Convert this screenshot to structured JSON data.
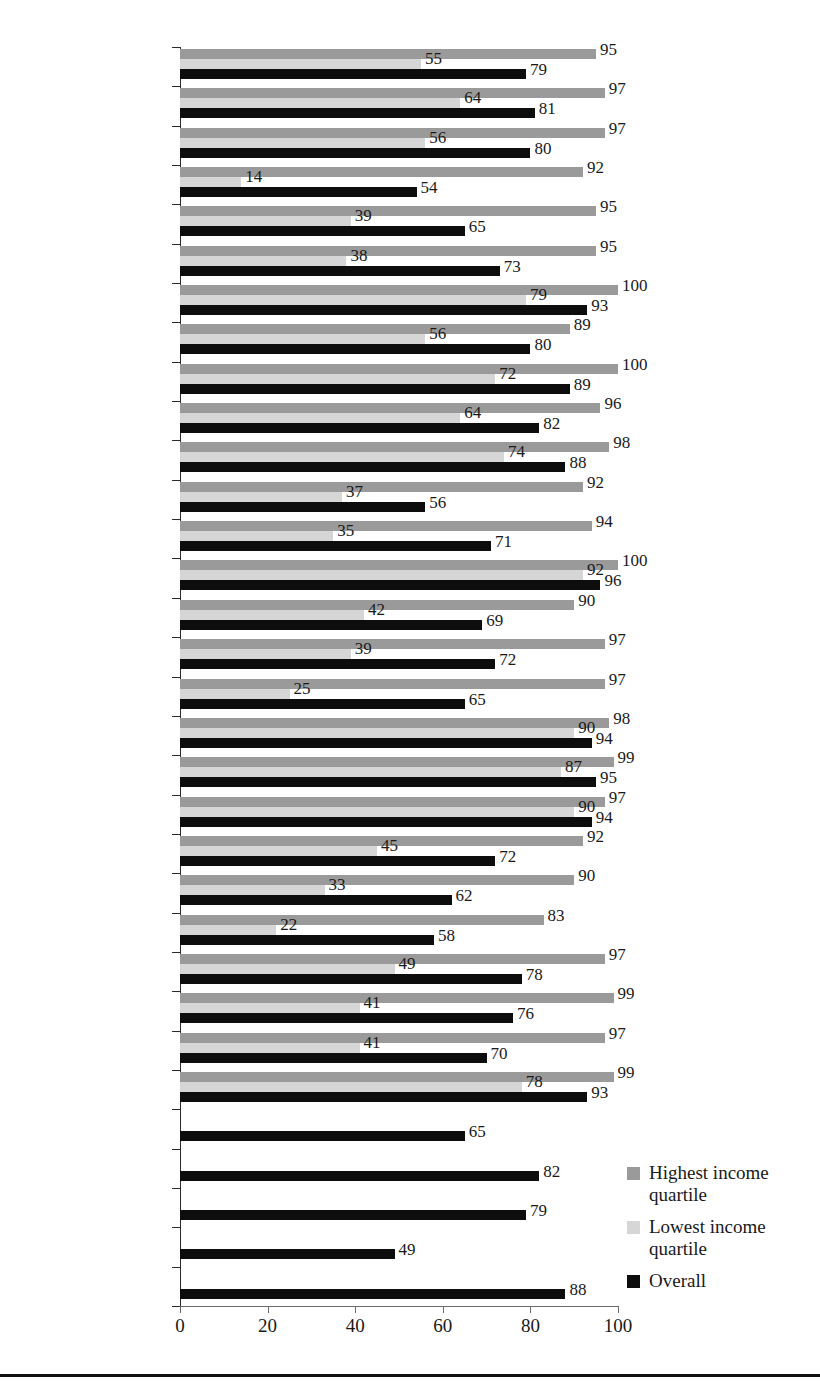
{
  "chart_data": {
    "type": "bar",
    "orientation": "horizontal",
    "title": "",
    "xlabel": "",
    "ylabel": "",
    "xlim": [
      0,
      100
    ],
    "xticks": [
      0,
      20,
      40,
      60,
      80,
      100
    ],
    "grid": false,
    "legend_position": "right-bottom",
    "categories": [
      "European Union",
      "Austria",
      "Belgium",
      "Bulgaria",
      "Cyprus",
      "Czech Republic",
      "Denmark",
      "Estonia",
      "Finland",
      "France",
      "Germany",
      "Greece",
      "Hungary",
      "Iceland",
      "Italy",
      "Latvia",
      "Lithuania",
      "Luxembourg",
      "Netherlands",
      "Norway",
      "Poland",
      "Portugal",
      "Romania",
      "Slovakia",
      "Slovenia",
      "Spain",
      "Sweden",
      "Croatia",
      "Ireland",
      "Malta",
      "Turkey",
      "United Kingdom"
    ],
    "series": [
      {
        "name": "Highest income quartile",
        "color": "#9a9a9a",
        "values": [
          95,
          97,
          97,
          92,
          95,
          95,
          100,
          89,
          100,
          96,
          98,
          92,
          94,
          100,
          90,
          97,
          97,
          98,
          99,
          97,
          92,
          90,
          83,
          97,
          99,
          97,
          99,
          null,
          null,
          null,
          null,
          null
        ]
      },
      {
        "name": "Lowest income quartile",
        "color": "#d6d6d6",
        "values": [
          55,
          64,
          56,
          14,
          39,
          38,
          79,
          56,
          72,
          64,
          74,
          37,
          35,
          92,
          42,
          39,
          25,
          90,
          87,
          90,
          45,
          33,
          22,
          49,
          41,
          41,
          78,
          null,
          null,
          null,
          null,
          null
        ]
      },
      {
        "name": "Overall",
        "color": "#0d0d0d",
        "values": [
          79,
          81,
          80,
          54,
          65,
          73,
          93,
          80,
          89,
          82,
          88,
          56,
          71,
          96,
          69,
          72,
          65,
          94,
          95,
          94,
          72,
          62,
          58,
          78,
          76,
          70,
          93,
          65,
          82,
          79,
          49,
          88
        ]
      }
    ]
  },
  "legend": {
    "items": [
      {
        "label": "Highest income quartile",
        "color": "#9a9a9a"
      },
      {
        "label": "Lowest income quartile",
        "color": "#d6d6d6"
      },
      {
        "label": "Overall",
        "color": "#0d0d0d"
      }
    ]
  }
}
